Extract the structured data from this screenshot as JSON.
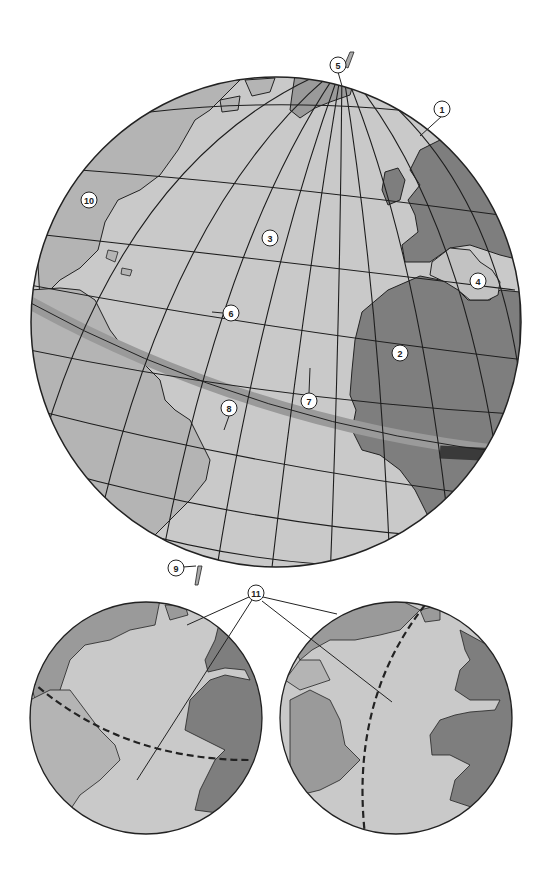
{
  "figure": {
    "colors": {
      "background": "#ffffff",
      "ocean": "#c9c9c9",
      "land_light": "#b4b4b4",
      "land_dark": "#7e7e7e",
      "equator_band": "#9a9a9a",
      "equator_band_dark": "#3a3a3a",
      "graticule": "#1e1e1e",
      "outline": "#222222"
    }
  },
  "main_globe": {
    "name": "main-globe",
    "callouts": [
      {
        "id": "1",
        "label": "1",
        "x": 442,
        "y": 109
      },
      {
        "id": "2",
        "label": "2",
        "x": 400,
        "y": 353
      },
      {
        "id": "3",
        "label": "3",
        "x": 270,
        "y": 238
      },
      {
        "id": "4",
        "label": "4",
        "x": 478,
        "y": 281
      },
      {
        "id": "5",
        "label": "5",
        "x": 338,
        "y": 65
      },
      {
        "id": "6",
        "label": "6",
        "x": 231,
        "y": 313
      },
      {
        "id": "7",
        "label": "7",
        "x": 309,
        "y": 401
      },
      {
        "id": "8",
        "label": "8",
        "x": 229,
        "y": 408
      },
      {
        "id": "9",
        "label": "9",
        "x": 176,
        "y": 568
      },
      {
        "id": "10",
        "label": "10",
        "x": 89,
        "y": 200
      }
    ]
  },
  "lower_globes": {
    "shared_callout": {
      "id": "11",
      "label": "11",
      "x": 256,
      "y": 593
    },
    "left": {
      "name": "left-small-globe",
      "great_circle": "dashed near-equatorial arc"
    },
    "right": {
      "name": "right-small-globe",
      "great_circle": "dashed near-meridian arc"
    }
  }
}
